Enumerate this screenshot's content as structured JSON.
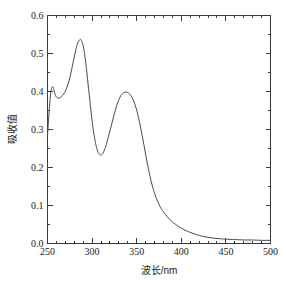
{
  "chart_data": {
    "type": "line",
    "title": "",
    "xlabel": "波长/nm",
    "ylabel": "吸收值",
    "xlim": [
      250,
      500
    ],
    "ylim": [
      0.0,
      0.6
    ],
    "grid": false,
    "legend": null,
    "xticks": [
      250,
      300,
      350,
      400,
      450,
      500
    ],
    "xtick_labels": [
      "250",
      "300",
      "350",
      "400",
      "450",
      "500"
    ],
    "x_minor_tick_step": 10,
    "yticks": [
      0.0,
      0.1,
      0.2,
      0.3,
      0.4,
      0.5,
      0.6
    ],
    "ytick_labels": [
      "0.0",
      "0.1",
      "0.2",
      "0.3",
      "0.4",
      "0.5",
      "0.6"
    ],
    "y_minor_tick_step": 0.05,
    "series": [
      {
        "name": "absorbance",
        "color": "#4a4a4a",
        "x": [
          250,
          251,
          252,
          253,
          254,
          255,
          256,
          257,
          258,
          259,
          260,
          262,
          264,
          266,
          268,
          270,
          272,
          274,
          276,
          278,
          280,
          282,
          284,
          286,
          287,
          288,
          290,
          292,
          294,
          296,
          298,
          300,
          302,
          304,
          306,
          308,
          310,
          312,
          314,
          316,
          318,
          320,
          322,
          324,
          326,
          328,
          330,
          332,
          334,
          336,
          338,
          340,
          342,
          344,
          346,
          348,
          350,
          352,
          354,
          356,
          358,
          360,
          362,
          364,
          366,
          368,
          370,
          372,
          374,
          376,
          378,
          380,
          384,
          388,
          392,
          396,
          400,
          404,
          408,
          412,
          416,
          420,
          425,
          430,
          435,
          440,
          445,
          450,
          460,
          470,
          480,
          490,
          500
        ],
        "y": [
          0.282,
          0.318,
          0.352,
          0.382,
          0.402,
          0.41,
          0.412,
          0.405,
          0.396,
          0.389,
          0.385,
          0.382,
          0.383,
          0.387,
          0.393,
          0.401,
          0.412,
          0.427,
          0.446,
          0.468,
          0.49,
          0.512,
          0.528,
          0.536,
          0.537,
          0.534,
          0.52,
          0.492,
          0.452,
          0.408,
          0.364,
          0.322,
          0.288,
          0.262,
          0.244,
          0.234,
          0.232,
          0.236,
          0.246,
          0.26,
          0.278,
          0.296,
          0.314,
          0.332,
          0.35,
          0.366,
          0.378,
          0.388,
          0.394,
          0.397,
          0.398,
          0.397,
          0.393,
          0.387,
          0.378,
          0.366,
          0.35,
          0.331,
          0.309,
          0.285,
          0.26,
          0.234,
          0.209,
          0.186,
          0.165,
          0.147,
          0.131,
          0.118,
          0.107,
          0.097,
          0.089,
          0.082,
          0.07,
          0.06,
          0.052,
          0.045,
          0.039,
          0.034,
          0.03,
          0.026,
          0.023,
          0.02,
          0.017,
          0.015,
          0.013,
          0.012,
          0.011,
          0.01,
          0.009,
          0.008,
          0.008,
          0.007,
          0.007
        ]
      }
    ],
    "peaks": [
      {
        "x": 256,
        "y": 0.412,
        "label": "shoulder peak"
      },
      {
        "x": 287,
        "y": 0.537,
        "label": "main peak"
      },
      {
        "x": 338,
        "y": 0.398,
        "label": "secondary peak"
      }
    ],
    "valleys": [
      {
        "x": 263,
        "y": 0.382
      },
      {
        "x": 310,
        "y": 0.232
      }
    ]
  },
  "style": {
    "frame_color": "#3c3c3c",
    "curve_color": "#4a4a4a",
    "background": "#ffffff",
    "text_color": "#1a1a1a"
  }
}
